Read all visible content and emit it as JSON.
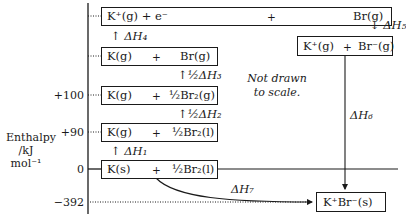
{
  "axis": {
    "title_line1": "Enthalpy",
    "title_line2": "/kJ mol⁻¹",
    "ticks": [
      {
        "label": "+100",
        "value": 100
      },
      {
        "label": "+90",
        "value": 90
      },
      {
        "label": "0",
        "value": 0
      },
      {
        "label": "−392",
        "value": -392
      }
    ]
  },
  "note": {
    "line1": "Not drawn",
    "line2": "to scale."
  },
  "levels": {
    "top": {
      "left": "K⁺(g) + e⁻",
      "plus": "+",
      "right": "Br(g)"
    },
    "atoms_gas": {
      "left": "K(g)",
      "plus": "+",
      "right": "Br(g)"
    },
    "plus100": {
      "left": "K(g)",
      "plus": "+",
      "right": "½Br₂(g)"
    },
    "plus90": {
      "left": "K(g)",
      "plus": "+",
      "right": "½Br₂(l)"
    },
    "zero": {
      "left": "K(s)",
      "plus": "+",
      "right": "½Br₂(l)"
    },
    "ions_gas": {
      "left": "K⁺(g)",
      "plus": "+",
      "right": "Br⁻(g)"
    },
    "product": {
      "label": "K⁺Br⁻(s)"
    }
  },
  "steps": {
    "dH1": "ΔH₁",
    "dH2": "½ΔH₂",
    "dH3": "½ΔH₃",
    "dH4": "ΔH₄",
    "dH5": "ΔH₅",
    "dH6": "ΔH₆",
    "dH7": "ΔH₇"
  }
}
